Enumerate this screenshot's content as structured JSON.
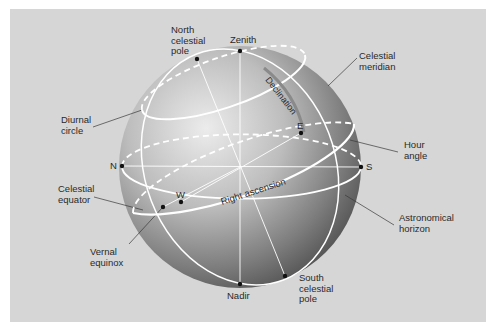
{
  "diagram": {
    "colors": {
      "background": "#d6d6d6",
      "border": "#ffffff",
      "sphere_light": "#e6e6e6",
      "sphere_dark": "#5a5a5a",
      "circles": "#ffffff",
      "text": "#2a2a2a",
      "leader_lines": "#3a3a3a"
    },
    "labels": {
      "north_celestial_pole": "North\ncelestial\npole",
      "zenith": "Zenith",
      "celestial_meridian": "Celestial\nmeridian",
      "diurnal_circle": "Diurnal\ncircle",
      "declination": "Declination",
      "hour_angle": "Hour\nangle",
      "celestial_equator": "Celestial\nequator",
      "right_ascension": "Right ascension",
      "astronomical_horizon": "Astronomical\nhorizon",
      "vernal_equinox": "Vernal\nequinox",
      "nadir": "Nadir",
      "south_celestial_pole": "South\ncelestial\npole"
    },
    "points": {
      "north": "N",
      "south": "S",
      "east": "E",
      "west": "W"
    }
  }
}
